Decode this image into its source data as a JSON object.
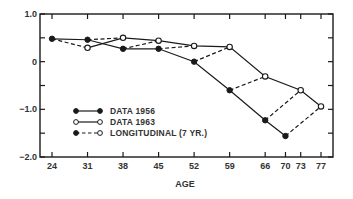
{
  "chart_data": {
    "type": "line",
    "title": "",
    "xlabel": "AGE",
    "ylabel": "",
    "xlim": [
      22,
      79
    ],
    "ylim": [
      -2.0,
      1.0
    ],
    "x_ticks": [
      24,
      31,
      38,
      45,
      52,
      59,
      66,
      70,
      73,
      77
    ],
    "y_ticks": [
      1.0,
      0.5,
      0,
      -0.5,
      -1.0,
      -1.5,
      -2.0
    ],
    "y_tick_labels": [
      {
        "value": 1.0,
        "label": "1.0"
      },
      {
        "value": 0,
        "label": "0"
      },
      {
        "value": -1.0,
        "label": "−1.0"
      },
      {
        "value": -2.0,
        "label": "−2.0"
      }
    ],
    "grid": false,
    "legend_position": "lower-left (inside)",
    "series": [
      {
        "name": "DATA 1956",
        "marker": "filled-circle",
        "line": "solid",
        "x": [
          24,
          31,
          38,
          45,
          52,
          59,
          66,
          70
        ],
        "values": [
          0.48,
          0.46,
          0.27,
          0.27,
          0.0,
          -0.6,
          -1.23,
          -1.56
        ]
      },
      {
        "name": "DATA 1963",
        "marker": "open-circle",
        "line": "solid",
        "x": [
          31,
          38,
          45,
          52,
          59,
          66,
          73,
          77
        ],
        "values": [
          0.29,
          0.5,
          0.44,
          0.33,
          0.31,
          -0.31,
          -0.6,
          -0.94
        ]
      },
      {
        "name": "LONGITUDINAL (7 YR.)",
        "marker": "filled-to-open",
        "line": "dashed",
        "segments": [
          {
            "from": [
              24,
              0.48
            ],
            "to": [
              31,
              0.29
            ]
          },
          {
            "from": [
              31,
              0.46
            ],
            "to": [
              38,
              0.5
            ]
          },
          {
            "from": [
              38,
              0.27
            ],
            "to": [
              45,
              0.44
            ]
          },
          {
            "from": [
              45,
              0.27
            ],
            "to": [
              52,
              0.33
            ]
          },
          {
            "from": [
              52,
              0.0
            ],
            "to": [
              59,
              0.31
            ]
          },
          {
            "from": [
              59,
              -0.6
            ],
            "to": [
              66,
              -0.31
            ]
          },
          {
            "from": [
              66,
              -1.23
            ],
            "to": [
              73,
              -0.6
            ]
          },
          {
            "from": [
              70,
              -1.56
            ],
            "to": [
              77,
              -0.94
            ]
          }
        ]
      }
    ]
  },
  "legend": {
    "items": [
      {
        "label": "DATA 1956",
        "style": "filled-solid"
      },
      {
        "label": "DATA 1963",
        "style": "open-solid"
      },
      {
        "label": "LONGITUDINAL (7 YR.)",
        "style": "filled-dashed-open"
      }
    ]
  },
  "axes": {
    "x_title": "AGE"
  },
  "colors": {
    "ink": "#1a1a1a",
    "text": "#333333",
    "background": "#ffffff"
  }
}
